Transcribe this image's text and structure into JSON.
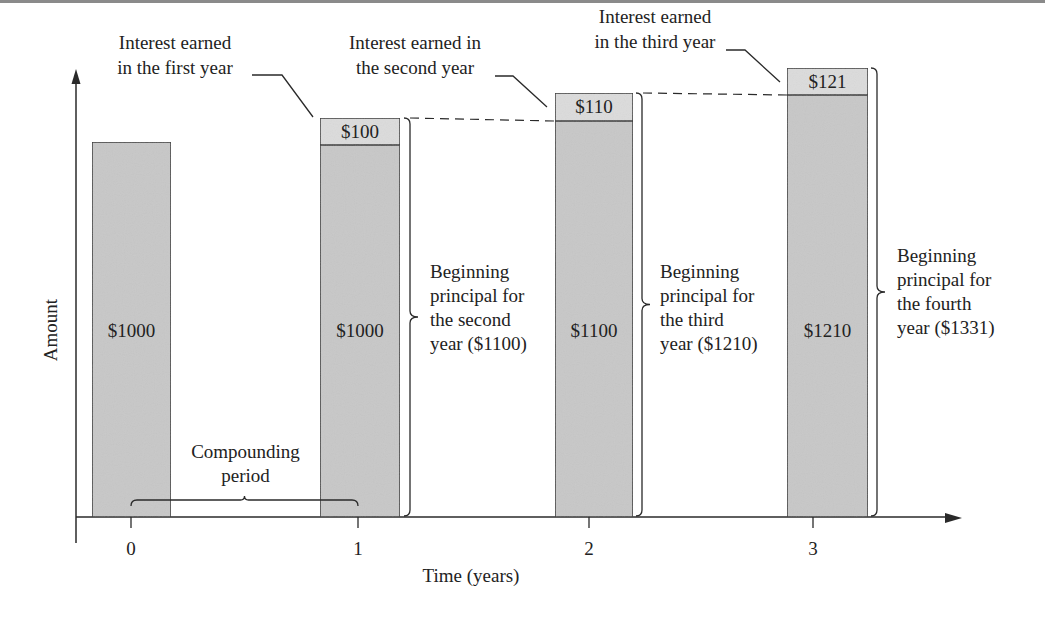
{
  "figure": {
    "type": "compound-interest-diagram",
    "y_axis_label": "Amount",
    "x_axis_label": "Time (years)",
    "ticks": [
      {
        "label": "0",
        "x": 131
      },
      {
        "label": "1",
        "x": 358
      },
      {
        "label": "2",
        "x": 589
      },
      {
        "label": "3",
        "x": 813
      }
    ],
    "colors": {
      "principal_fill": "#c8c8c8",
      "interest_fill": "#dcdcdc",
      "stroke": "#2a2a2a",
      "text": "#222222"
    },
    "bars": [
      {
        "year": 0,
        "principal_label": "$1000",
        "interest_label": null,
        "x": 92,
        "w": 79,
        "top": 142,
        "divider": null
      },
      {
        "year": 1,
        "principal_label": "$1000",
        "interest_label": "$100",
        "x": 320,
        "w": 80,
        "top": 118,
        "divider": 145
      },
      {
        "year": 2,
        "principal_label": "$1100",
        "interest_label": "$110",
        "x": 555,
        "w": 78,
        "top": 93,
        "divider": 121
      },
      {
        "year": 3,
        "principal_label": "$1210",
        "interest_label": "$121",
        "x": 787,
        "w": 81,
        "top": 68,
        "divider": 95
      }
    ],
    "interest_callouts": [
      {
        "line1": "Interest earned",
        "line2": "in the first year",
        "tx": 175,
        "ty1": 49,
        "ty2": 74,
        "hx1": 252,
        "hx2": 282,
        "hy": 75,
        "px": 313,
        "py": 117
      },
      {
        "line1": "Interest earned in",
        "line2": "the second year",
        "tx": 415,
        "ty1": 49,
        "ty2": 74,
        "hx1": 495,
        "hx2": 513,
        "hy": 76,
        "px": 547,
        "py": 107
      },
      {
        "line1": "Interest earned",
        "line2": "in the third year",
        "tx": 655,
        "ty1": 23,
        "ty2": 48,
        "hx1": 726,
        "hx2": 745,
        "hy": 50,
        "px": 780,
        "py": 82
      }
    ],
    "principal_callouts": [
      {
        "lines": [
          "Beginning",
          "principal for",
          "the second",
          "year ($1100)"
        ],
        "tx": 430,
        "ty": 278,
        "bx": 404,
        "btop": 118,
        "bbot": 516
      },
      {
        "lines": [
          "Beginning",
          "principal for",
          "the third",
          "year ($1210)"
        ],
        "tx": 660,
        "ty": 278,
        "bx": 636,
        "btop": 93,
        "bbot": 516
      },
      {
        "lines": [
          "Beginning",
          "principal for",
          "the fourth",
          "year ($1331)"
        ],
        "tx": 897,
        "ty": 262,
        "bx": 871,
        "btop": 68,
        "bbot": 516
      }
    ],
    "compounding_period": {
      "line1": "Compounding",
      "line2": "period",
      "x1": 131,
      "x2": 358,
      "y": 500
    }
  },
  "chart_data": {
    "type": "bar",
    "title": "",
    "xlabel": "Time (years)",
    "ylabel": "Amount",
    "categories": [
      "0",
      "1",
      "2",
      "3"
    ],
    "series": [
      {
        "name": "Principal",
        "values": [
          1000,
          1000,
          1100,
          1210
        ]
      },
      {
        "name": "Interest earned",
        "values": [
          0,
          100,
          110,
          121
        ]
      }
    ],
    "stacked": true,
    "annotations": [
      "Interest earned in the first year",
      "Interest earned in the second year",
      "Interest earned in the third year",
      "Beginning principal for the second year ($1100)",
      "Beginning principal for the third year ($1210)",
      "Beginning principal for the fourth year ($1331)",
      "Compounding period"
    ],
    "grid": false,
    "legend": "none"
  }
}
